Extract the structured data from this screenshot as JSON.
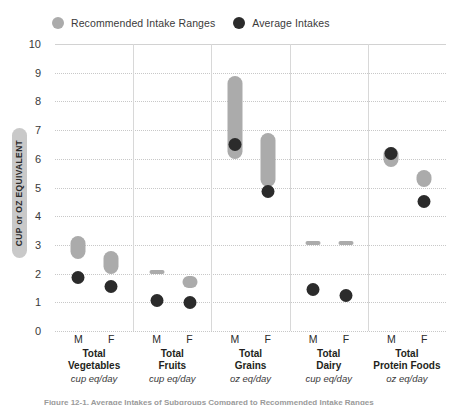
{
  "legend": {
    "items": [
      {
        "label": "Recommended Intake Ranges",
        "marker": "range-dot-icon",
        "color": "#ababab"
      },
      {
        "label": "Average Intakes",
        "marker": "average-dot-icon",
        "color": "#2b2b2b"
      }
    ]
  },
  "axis": {
    "y_title": "CUP or OZ EQUIVALENT",
    "y_ticks": [
      "10",
      "9",
      "8",
      "7",
      "6",
      "5",
      "4",
      "3",
      "2",
      "1",
      "0"
    ],
    "sex_ticks": [
      "M",
      "F"
    ]
  },
  "caption": "Figure 12-1. Average Intakes of Subgroups Compared to Recommended Intake Ranges",
  "chart_data": {
    "type": "bar",
    "title": "",
    "xlabel": "",
    "ylabel": "CUP or OZ EQUIVALENT",
    "ylim": [
      0,
      10
    ],
    "yticks": [
      0,
      1,
      2,
      3,
      4,
      5,
      6,
      7,
      8,
      9,
      10
    ],
    "grid": true,
    "legend_position": "top-left",
    "categories": [
      "Total Vegetables M",
      "Total Vegetables F",
      "Total Fruits M",
      "Total Fruits F",
      "Total Grains M",
      "Total Grains F",
      "Total Dairy M",
      "Total Dairy F",
      "Total Protein Foods M",
      "Total Protein Foods F"
    ],
    "groups": [
      {
        "name": "Total Vegetables",
        "unit": "cup eq/day",
        "series": [
          {
            "sex": "M",
            "range_low": 2.5,
            "range_high": 3.3,
            "average": 1.85
          },
          {
            "sex": "F",
            "range_low": 2.0,
            "range_high": 2.8,
            "average": 1.55
          }
        ]
      },
      {
        "name": "Total Fruits",
        "unit": "cup eq/day",
        "series": [
          {
            "sex": "M",
            "range_low": 2.0,
            "range_high": 2.0,
            "average": 1.05
          },
          {
            "sex": "F",
            "range_low": 1.5,
            "range_high": 1.9,
            "average": 1.0
          }
        ]
      },
      {
        "name": "Total Grains",
        "unit": "oz eq/day",
        "series": [
          {
            "sex": "M",
            "range_low": 6.0,
            "range_high": 8.9,
            "average": 6.5
          },
          {
            "sex": "F",
            "range_low": 5.0,
            "range_high": 6.9,
            "average": 4.85
          }
        ]
      },
      {
        "name": "Total Dairy",
        "unit": "cup eq/day",
        "series": [
          {
            "sex": "M",
            "range_low": 3.0,
            "range_high": 3.0,
            "average": 1.45
          },
          {
            "sex": "F",
            "range_low": 3.0,
            "range_high": 3.0,
            "average": 1.25
          }
        ]
      },
      {
        "name": "Total Protein Foods",
        "unit": "oz eq/day",
        "series": [
          {
            "sex": "M",
            "range_low": 5.7,
            "range_high": 6.4,
            "average": 6.2
          },
          {
            "sex": "F",
            "range_low": 5.0,
            "range_high": 5.6,
            "average": 4.5
          }
        ]
      }
    ],
    "colors": {
      "range": "#ababab",
      "average": "#2b2b2b",
      "grid": "#c8c8c8"
    }
  }
}
